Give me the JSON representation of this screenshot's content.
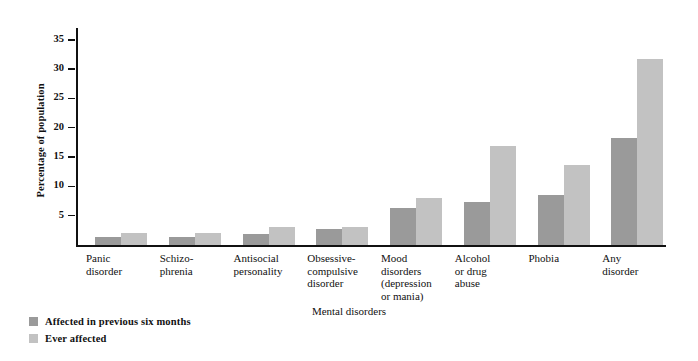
{
  "chart_data": {
    "type": "bar",
    "title": "",
    "xlabel": "Mental disorders",
    "ylabel": "Percentage of population",
    "ylim": [
      0,
      37
    ],
    "yticks": [
      5,
      10,
      15,
      20,
      25,
      30,
      35
    ],
    "ytick_labels": [
      "5",
      "10",
      "15",
      "20",
      "25",
      "30",
      "35"
    ],
    "grid": false,
    "legend_position": "below-left",
    "categories": [
      "Panic disorder",
      "Schizophrenia",
      "Antisocial personality",
      "Obsessive-compulsive disorder",
      "Mood disorders (depression or mania)",
      "Alcohol or drug abuse",
      "Phobia",
      "Any disorder"
    ],
    "category_lines": [
      [
        "Panic",
        "disorder"
      ],
      [
        "Schizo-",
        "phrenia"
      ],
      [
        "Antisocial",
        "personality"
      ],
      [
        "Obsessive-",
        "compulsive",
        "disorder"
      ],
      [
        "Mood",
        "disorders",
        "(depression",
        "or mania)"
      ],
      [
        "Alcohol",
        "or drug",
        "abuse"
      ],
      [
        "Phobia"
      ],
      [
        "Any",
        "disorder"
      ]
    ],
    "series": [
      {
        "name": "Affected in previous six months",
        "color": "#9a9a9a",
        "values": [
          1.4,
          1.3,
          1.8,
          2.8,
          6.3,
          7.4,
          8.5,
          18.2
        ]
      },
      {
        "name": "Ever affected",
        "color": "#c2c2c2",
        "values": [
          2.1,
          2.0,
          3.0,
          3.0,
          8.0,
          16.9,
          13.7,
          31.8
        ]
      }
    ]
  },
  "legend": {
    "items": [
      {
        "label": "Affected in previous six months"
      },
      {
        "label": "Ever affected"
      }
    ]
  },
  "colors": {
    "series_dark": "#9a9a9a",
    "series_light": "#c2c2c2",
    "axis": "#111111",
    "background": "#ffffff"
  }
}
